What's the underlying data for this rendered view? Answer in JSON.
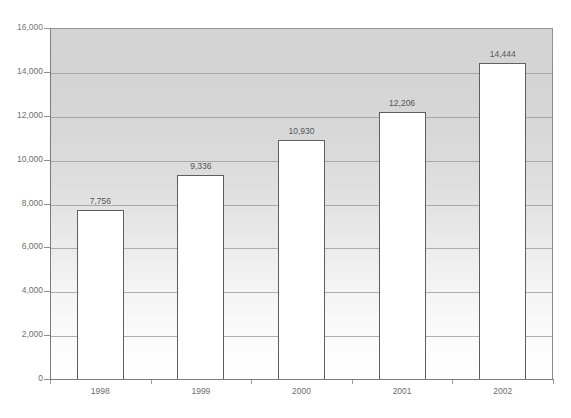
{
  "chart_data": {
    "type": "bar",
    "title": "",
    "subtitle": "",
    "xlabel": "",
    "ylabel": "",
    "categories": [
      "1998",
      "1999",
      "2000",
      "2001",
      "2002"
    ],
    "values": [
      7756,
      9336,
      10930,
      12206,
      14444
    ],
    "value_labels": [
      "7,756",
      "9,336",
      "10,930",
      "12,206",
      "14,444"
    ],
    "ylim": [
      0,
      16000
    ],
    "ytick_step": 2000,
    "ytick_values": [
      0,
      2000,
      4000,
      6000,
      8000,
      10000,
      12000,
      14000,
      16000
    ],
    "ytick_labels": [
      "0",
      "2,000",
      "4,000",
      "6,000",
      "8,000",
      "10,000",
      "12,000",
      "14,000",
      "16,000"
    ],
    "grid": true,
    "grid_axis": "y",
    "legend": false,
    "legend_position": "none",
    "bar_fill_color": "#ffffff",
    "bar_border_color": "#5e5e5e",
    "plot_background_top_color": "#d2d2d2",
    "plot_background_bottom_color": "#ffffff",
    "gridline_color": "#9a9a9a",
    "axis_color": "#7a7a7a",
    "text_color": "#6d6d6d",
    "data_label_color": "#555555"
  }
}
